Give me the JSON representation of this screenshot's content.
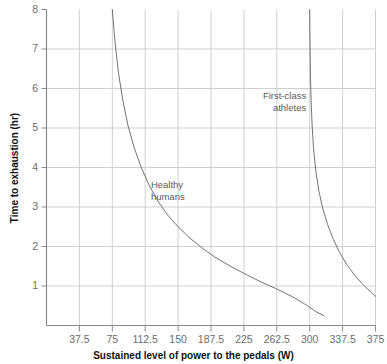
{
  "chart_data": {
    "type": "line",
    "title": "",
    "xlabel": "Sustained level of power to the pedals (W)",
    "ylabel": "Time to exhaustion (hr)",
    "xlim": [
      0,
      375
    ],
    "ylim": [
      0,
      8
    ],
    "grid": true,
    "legend_position": "inline-annotations",
    "xticks": [
      "37.5",
      "75",
      "112.5",
      "150",
      "187.5",
      "225",
      "262.5",
      "300",
      "337.5",
      "375"
    ],
    "xtick_values": [
      37.5,
      75,
      112.5,
      150,
      187.5,
      225,
      262.5,
      300,
      337.5,
      375
    ],
    "yticks": [
      "1",
      "2",
      "3",
      "4",
      "5",
      "6",
      "7",
      "8"
    ],
    "ytick_values": [
      1,
      2,
      3,
      4,
      5,
      6,
      7,
      8
    ],
    "series": [
      {
        "name": "Healthy humans",
        "color": "#6b6b6b",
        "x": [
          75,
          78,
          82,
          87,
          93,
          100,
          108,
          117,
          127,
          138,
          150,
          163,
          177,
          192,
          208,
          225,
          243,
          262,
          281,
          296,
          308,
          316
        ],
        "y": [
          8.0,
          7.2,
          6.4,
          5.7,
          5.05,
          4.5,
          4.0,
          3.55,
          3.15,
          2.8,
          2.5,
          2.22,
          1.97,
          1.73,
          1.52,
          1.32,
          1.12,
          0.93,
          0.72,
          0.52,
          0.34,
          0.25
        ]
      },
      {
        "name": "First-class athletes",
        "color": "#6b6b6b",
        "x": [
          300,
          300.3,
          300.8,
          301.6,
          302.8,
          304.5,
          307,
          310.5,
          315,
          320.5,
          327,
          334,
          342,
          351,
          361,
          372,
          375
        ],
        "y": [
          8.0,
          7.2,
          6.4,
          5.7,
          5.05,
          4.45,
          3.9,
          3.4,
          2.95,
          2.55,
          2.18,
          1.85,
          1.55,
          1.28,
          1.03,
          0.8,
          0.74
        ]
      }
    ],
    "annotations": [
      {
        "text_line1": "Healthy",
        "text_line2": "humans",
        "x": 119,
        "y": 3.55
      },
      {
        "text_line1": "First-class",
        "text_line2": "athletes",
        "x": 296,
        "y": 5.8
      }
    ]
  },
  "axes": {
    "y_axis_title": "Time to exhaustion (hr)",
    "x_axis_title": "Sustained level of power to the pedals (W)"
  },
  "colors": {
    "curve": "#6b6b6b",
    "gridline": "#c9c9c9",
    "axis": "#8a8a8a",
    "tick_label": "#6d6d6d",
    "axis_title": "#111111",
    "annotation": "#5a5a5a",
    "background": "#ffffff"
  }
}
